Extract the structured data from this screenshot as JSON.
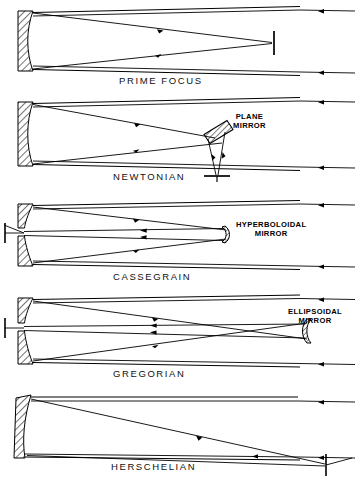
{
  "figure": {
    "style": "line-diagram",
    "background": "#ffffff",
    "ink": "#000000"
  },
  "panels": [
    {
      "id": "prime-focus",
      "caption": "PRIME FOCUS",
      "mirror_labels": [],
      "elements": [
        "primary-mirror",
        "incoming-rays",
        "converging-rays",
        "focus-marker",
        "tube-walls"
      ]
    },
    {
      "id": "newtonian",
      "caption": "NEWTONIAN",
      "mirror_labels": [
        {
          "id": "plane-mirror",
          "line1": "PLANE",
          "line2": "MIRROR"
        }
      ],
      "elements": [
        "primary-mirror",
        "incoming-rays",
        "converging-rays",
        "diagonal-flat",
        "focus-marker",
        "tube-walls"
      ]
    },
    {
      "id": "cassegrain",
      "caption": "CASSEGRAIN",
      "mirror_labels": [
        {
          "id": "hyperboloidal-mirror",
          "line1": "HYPERBOLOIDAL",
          "line2": "MIRROR"
        }
      ],
      "elements": [
        "primary-mirror",
        "incoming-rays",
        "converging-rays",
        "convex-secondary",
        "perforated-primary",
        "focus-marker",
        "tube-walls"
      ]
    },
    {
      "id": "gregorian",
      "caption": "GREGORIAN",
      "mirror_labels": [
        {
          "id": "ellipsoidal-mirror",
          "line1": "ELLIPSOIDAL",
          "line2": "MIRROR"
        }
      ],
      "elements": [
        "primary-mirror",
        "incoming-rays",
        "crossing-rays",
        "concave-secondary",
        "perforated-primary",
        "focus-marker",
        "tube-walls"
      ]
    },
    {
      "id": "herschelian",
      "caption": "HERSCHELIAN",
      "mirror_labels": [],
      "elements": [
        "tilted-primary-mirror",
        "incoming-rays",
        "oblique-converging-rays",
        "focus-marker",
        "tube-walls"
      ]
    }
  ]
}
